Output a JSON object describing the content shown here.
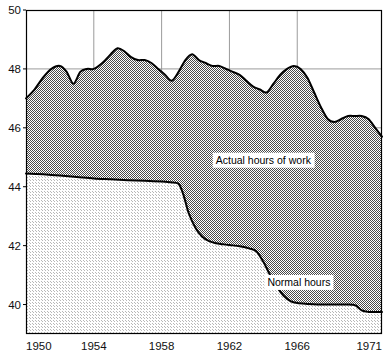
{
  "chart_data": {
    "type": "area",
    "title": "",
    "subtitle": "",
    "xlabel": "",
    "ylabel": "",
    "xlim": [
      1950,
      1971
    ],
    "ylim": [
      39,
      50
    ],
    "grid": true,
    "legend_position": "inline-annotation",
    "x_ticks": [
      {
        "value": 1950,
        "label": "1950"
      },
      {
        "value": 1954,
        "label": "1954"
      },
      {
        "value": 1958,
        "label": "1958"
      },
      {
        "value": 1962,
        "label": "1962"
      },
      {
        "value": 1966,
        "label": "1966"
      },
      {
        "value": 1971,
        "label": "1971"
      }
    ],
    "y_ticks": [
      {
        "value": 40,
        "label": "40"
      },
      {
        "value": 42,
        "label": "42"
      },
      {
        "value": 44,
        "label": "44"
      },
      {
        "value": 46,
        "label": "46"
      },
      {
        "value": 48,
        "label": "48"
      },
      {
        "value": 50,
        "label": "50"
      }
    ],
    "annotations": [
      {
        "name": "actual-hours-label",
        "text": "Actual hours of work",
        "x": 1964.0,
        "y": 44.9
      },
      {
        "name": "normal-hours-label",
        "text": "Normal hours",
        "x": 1966.1,
        "y": 40.75
      }
    ],
    "series": [
      {
        "name": "Actual hours of work",
        "fill": "dark-dotted",
        "x": [
          1950.0,
          1950.5,
          1951.0,
          1951.5,
          1952.0,
          1952.4,
          1952.8,
          1953.2,
          1953.6,
          1954.0,
          1954.5,
          1955.0,
          1955.4,
          1955.8,
          1956.2,
          1956.6,
          1957.0,
          1957.4,
          1957.8,
          1958.2,
          1958.6,
          1959.0,
          1959.4,
          1959.8,
          1960.2,
          1960.6,
          1961.0,
          1961.4,
          1961.8,
          1962.2,
          1962.6,
          1963.0,
          1963.4,
          1963.8,
          1964.2,
          1964.6,
          1965.0,
          1965.4,
          1965.8,
          1966.2,
          1966.6,
          1967.0,
          1967.4,
          1967.8,
          1968.2,
          1968.6,
          1969.0,
          1969.4,
          1969.8,
          1970.2,
          1970.6,
          1971.0
        ],
        "values": [
          47.0,
          47.3,
          47.7,
          48.0,
          48.1,
          47.9,
          47.5,
          47.9,
          48.0,
          48.0,
          48.2,
          48.5,
          48.7,
          48.6,
          48.4,
          48.3,
          48.3,
          48.2,
          48.0,
          47.8,
          47.6,
          47.9,
          48.3,
          48.5,
          48.3,
          48.2,
          48.1,
          48.1,
          48.0,
          47.9,
          47.8,
          47.6,
          47.4,
          47.3,
          47.2,
          47.5,
          47.8,
          48.0,
          48.1,
          48.0,
          47.7,
          47.2,
          46.7,
          46.3,
          46.2,
          46.3,
          46.4,
          46.4,
          46.4,
          46.3,
          46.0,
          45.7
        ]
      },
      {
        "name": "Normal hours",
        "fill": "light-dotted",
        "x": [
          1950.0,
          1951.0,
          1952.0,
          1953.0,
          1954.0,
          1955.0,
          1956.0,
          1957.0,
          1958.0,
          1958.5,
          1959.0,
          1959.3,
          1959.6,
          1960.0,
          1960.4,
          1960.8,
          1961.2,
          1961.6,
          1962.0,
          1962.6,
          1963.2,
          1963.6,
          1964.0,
          1964.4,
          1964.8,
          1965.2,
          1965.6,
          1966.0,
          1966.6,
          1967.2,
          1968.0,
          1968.8,
          1969.4,
          1969.8,
          1970.2,
          1970.6,
          1971.0
        ],
        "values": [
          44.45,
          44.42,
          44.38,
          44.33,
          44.28,
          44.25,
          44.22,
          44.2,
          44.18,
          44.15,
          44.1,
          43.7,
          43.1,
          42.6,
          42.3,
          42.15,
          42.08,
          42.05,
          42.02,
          41.98,
          41.9,
          41.8,
          41.45,
          41.0,
          40.6,
          40.3,
          40.12,
          40.05,
          40.02,
          40.0,
          40.0,
          40.0,
          39.98,
          39.8,
          39.75,
          39.75,
          39.75
        ]
      }
    ]
  },
  "plot": {
    "left": 26,
    "right": 382,
    "top": 10,
    "bottom": 334
  }
}
